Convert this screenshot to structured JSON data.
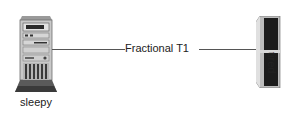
{
  "diagram": {
    "nodes": [
      {
        "id": "sleepy",
        "label": "sleepy",
        "icon": "tower-server-icon"
      },
      {
        "id": "tired",
        "label": "tired",
        "icon": "rack-server-icon"
      }
    ],
    "links": [
      {
        "from": "sleepy",
        "to": "tired",
        "label": "Fractional T1"
      }
    ]
  }
}
